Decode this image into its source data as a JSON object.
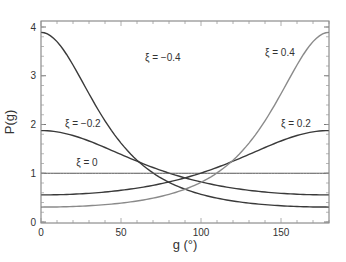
{
  "chart_data": {
    "type": "line",
    "title": "",
    "xlabel": "g (°)",
    "ylabel": "P(g)",
    "xlim": [
      0,
      180
    ],
    "ylim": [
      0,
      4
    ],
    "grid": false,
    "legend": "inline annotations",
    "x_ticks": [
      0,
      50,
      100,
      150
    ],
    "y_ticks": [
      0,
      1,
      2,
      3,
      4
    ],
    "x": [
      0,
      20,
      40,
      60,
      80,
      100,
      120,
      140,
      160,
      180
    ],
    "series": [
      {
        "name": "ξ = −0.4",
        "color": "#3a3a3a",
        "xi": -0.4,
        "values": [
          3.89,
          3.18,
          1.93,
          1.12,
          0.7,
          0.48,
          0.37,
          0.32,
          0.31,
          0.31
        ]
      },
      {
        "name": "ξ = −0.2",
        "color": "#3a3a3a",
        "xi": -0.2,
        "values": [
          1.88,
          1.76,
          1.49,
          1.18,
          0.93,
          0.76,
          0.65,
          0.59,
          0.56,
          0.56
        ]
      },
      {
        "name": "ξ = 0",
        "color": "#555555",
        "xi": 0,
        "values": [
          1,
          1,
          1,
          1,
          1,
          1,
          1,
          1,
          1,
          1
        ]
      },
      {
        "name": "ξ = 0.2",
        "color": "#3a3a3a",
        "xi": 0.2,
        "values": [
          0.56,
          0.56,
          0.59,
          0.65,
          0.76,
          0.93,
          1.18,
          1.49,
          1.76,
          1.88
        ]
      },
      {
        "name": "ξ = 0.4",
        "color": "#8a8a8a",
        "xi": 0.4,
        "values": [
          0.31,
          0.31,
          0.32,
          0.37,
          0.48,
          0.7,
          1.12,
          1.93,
          3.18,
          3.89
        ]
      }
    ],
    "annotations": [
      {
        "text": "ξ = −0.4",
        "x": 65,
        "y": 3.3
      },
      {
        "text": "ξ = −0.2",
        "x": 15,
        "y": 1.95
      },
      {
        "text": "ξ = 0",
        "x": 22,
        "y": 1.15
      },
      {
        "text": "ξ = 0.4",
        "x": 140,
        "y": 3.4
      },
      {
        "text": "ξ = 0.2",
        "x": 150,
        "y": 1.95
      }
    ]
  }
}
